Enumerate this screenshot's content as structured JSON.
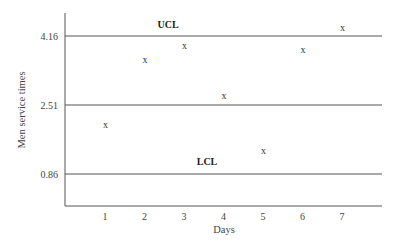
{
  "chart_data": {
    "type": "scatter",
    "title": "",
    "xlabel": "Days",
    "ylabel": "Men service times",
    "x": [
      1,
      2,
      3,
      4,
      5,
      6,
      7
    ],
    "series": [
      {
        "name": "Men service times",
        "marker": "x",
        "values": [
          2.03,
          3.59,
          3.92,
          2.73,
          1.41,
          3.83,
          4.35
        ]
      }
    ],
    "y_ticks": [
      "4.16",
      "2.51",
      "0.86"
    ],
    "x_ticks": [
      "1",
      "2",
      "3",
      "4",
      "5",
      "6",
      "7"
    ],
    "control_lines": [
      {
        "name": "UCL",
        "value": 4.16,
        "label": "UCL"
      },
      {
        "name": "CL",
        "value": 2.51,
        "label": ""
      },
      {
        "name": "LCL",
        "value": 0.86,
        "label": "LCL"
      }
    ],
    "ylim": [
      0.0,
      5.1
    ],
    "xlim": [
      0,
      8
    ],
    "grid": false,
    "legend": "none"
  },
  "labels": {
    "ucl": "UCL",
    "lcl": "LCL",
    "xlabel": "Days",
    "ylabel": "Men service times",
    "marker": "x"
  },
  "colors": {
    "axis": "#555555",
    "line": "#555555",
    "text": "#333333"
  }
}
